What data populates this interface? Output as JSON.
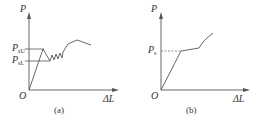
{
  "panels": [
    {
      "id": "a",
      "caption": "(a)",
      "axis_y_label": "P",
      "axis_x_label": "ΔL",
      "origin_label": "O",
      "levels": [
        {
          "symbol": "P",
          "sub": "sU",
          "name": "upper yield load"
        },
        {
          "symbol": "P",
          "sub": "sL",
          "name": "lower yield load"
        }
      ]
    },
    {
      "id": "b",
      "caption": "(b)",
      "axis_y_label": "P",
      "axis_x_label": "ΔL",
      "origin_label": "O",
      "levels": [
        {
          "symbol": "P",
          "sub": "s",
          "name": "yield load"
        }
      ]
    }
  ],
  "colors": {
    "line": "#555555",
    "text": "#333333",
    "dash": "#777777"
  }
}
